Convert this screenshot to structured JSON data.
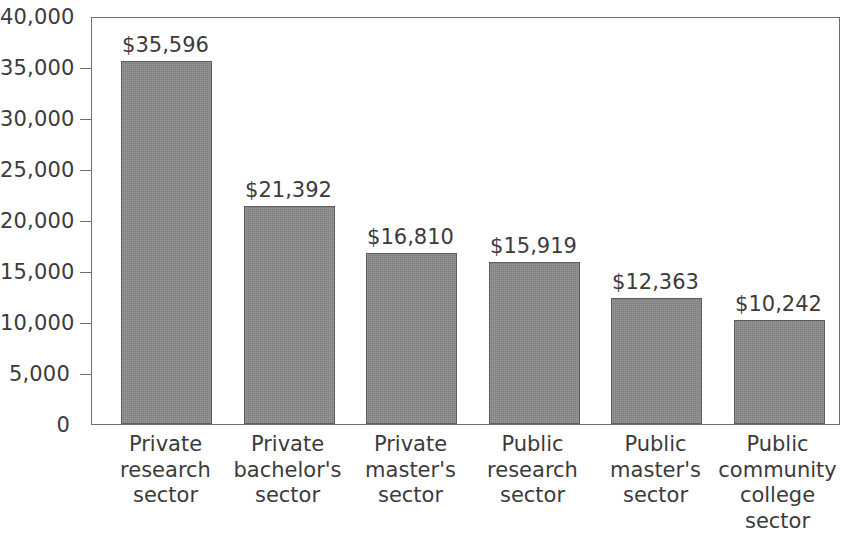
{
  "chart_data": {
    "type": "bar",
    "title": "",
    "subtitle": "",
    "xlabel": "",
    "ylabel": "",
    "ylim": [
      0,
      40000
    ],
    "ytick_step": 5000,
    "grid": false,
    "legend": null,
    "orientation": "vertical",
    "categories": [
      "Private\nresearch\nsector",
      "Private\nbachelor's\nsector",
      "Private\nmaster's\nsector",
      "Public\nresearch\nsector",
      "Public\nmaster's\nsector",
      "Public\ncommunity\ncollege\nsector"
    ],
    "values": [
      35596,
      21392,
      16810,
      15919,
      12363,
      10242
    ],
    "value_labels": [
      "$35,596",
      "$21,392",
      "$16,810",
      "$15,919",
      "$12,363",
      "$10,242"
    ],
    "ytick_labels": [
      "40,000",
      "35,000",
      "30,000",
      "25,000",
      "20,000",
      "15,000",
      "10,000",
      "5,000",
      "0"
    ],
    "ytick_values": [
      40000,
      35000,
      30000,
      25000,
      20000,
      15000,
      10000,
      5000,
      0
    ],
    "colors": {
      "bar_fill": "#8a8a8a",
      "bar_border": "#5d5d5d",
      "axis": "#6f6f6f",
      "text": "#3b3b3b",
      "background": "#ffffff"
    }
  }
}
